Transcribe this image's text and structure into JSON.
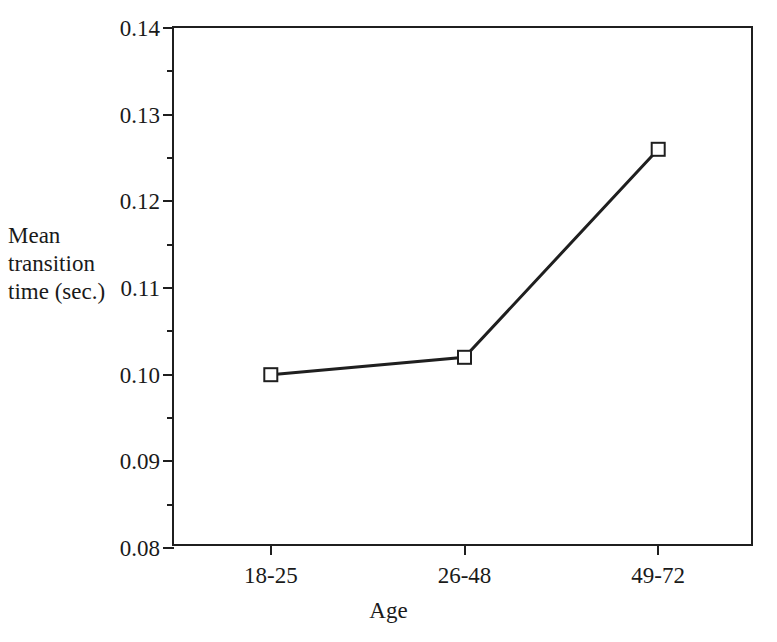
{
  "chart_data": {
    "type": "line",
    "title": "",
    "xlabel": "Age",
    "ylabel": "Mean transition time (sec.)",
    "ylabel_lines": [
      "Mean",
      "transition",
      "time (sec.)"
    ],
    "categories": [
      "18-25",
      "26-48",
      "49-72"
    ],
    "values": [
      0.1,
      0.102,
      0.126
    ],
    "series": [
      {
        "name": "Mean transition time",
        "values": [
          0.1,
          0.102,
          0.126
        ],
        "marker": "open-square",
        "color": "#1f1f1f"
      }
    ],
    "ylim": [
      0.08,
      0.14
    ],
    "ytick_labels": [
      "0.08",
      "0.09",
      "0.10",
      "0.11",
      "0.12",
      "0.13",
      "0.14"
    ],
    "ytick_values": [
      0.08,
      0.09,
      0.1,
      0.11,
      0.12,
      0.13,
      0.14
    ],
    "yminor_tick_values": [
      0.085,
      0.095,
      0.105,
      0.115,
      0.125,
      0.135
    ],
    "grid": false,
    "legend": false,
    "frame": true,
    "tick_direction": "out",
    "background_color": "#ffffff",
    "axis_color": "#1f1f1f",
    "text_color": "#1a1a1a"
  }
}
